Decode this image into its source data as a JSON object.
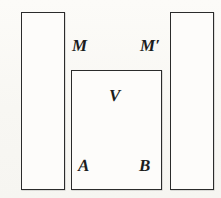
{
  "figure": {
    "background_color": "#fbfaf7",
    "stroke_color": "#2b2b2b",
    "fill_color": "#fdfcfa",
    "width": 221,
    "height": 198,
    "shapes": [
      {
        "name": "left-column-rectangle",
        "x": 21,
        "y": 12,
        "width": 44,
        "height": 178
      },
      {
        "name": "center-rectangle",
        "x": 71,
        "y": 70,
        "width": 91,
        "height": 120
      },
      {
        "name": "right-column-rectangle",
        "x": 170,
        "y": 12,
        "width": 44,
        "height": 178
      }
    ],
    "labels": [
      {
        "name": "label-M",
        "text": "M",
        "x": 72,
        "y": 37
      },
      {
        "name": "label-M-prime",
        "text": "M′",
        "x": 140,
        "y": 37
      },
      {
        "name": "label-V",
        "text": "V",
        "x": 109,
        "y": 87
      },
      {
        "name": "label-A",
        "text": "A",
        "x": 78,
        "y": 157
      },
      {
        "name": "label-B",
        "text": "B",
        "x": 139,
        "y": 157
      }
    ]
  }
}
